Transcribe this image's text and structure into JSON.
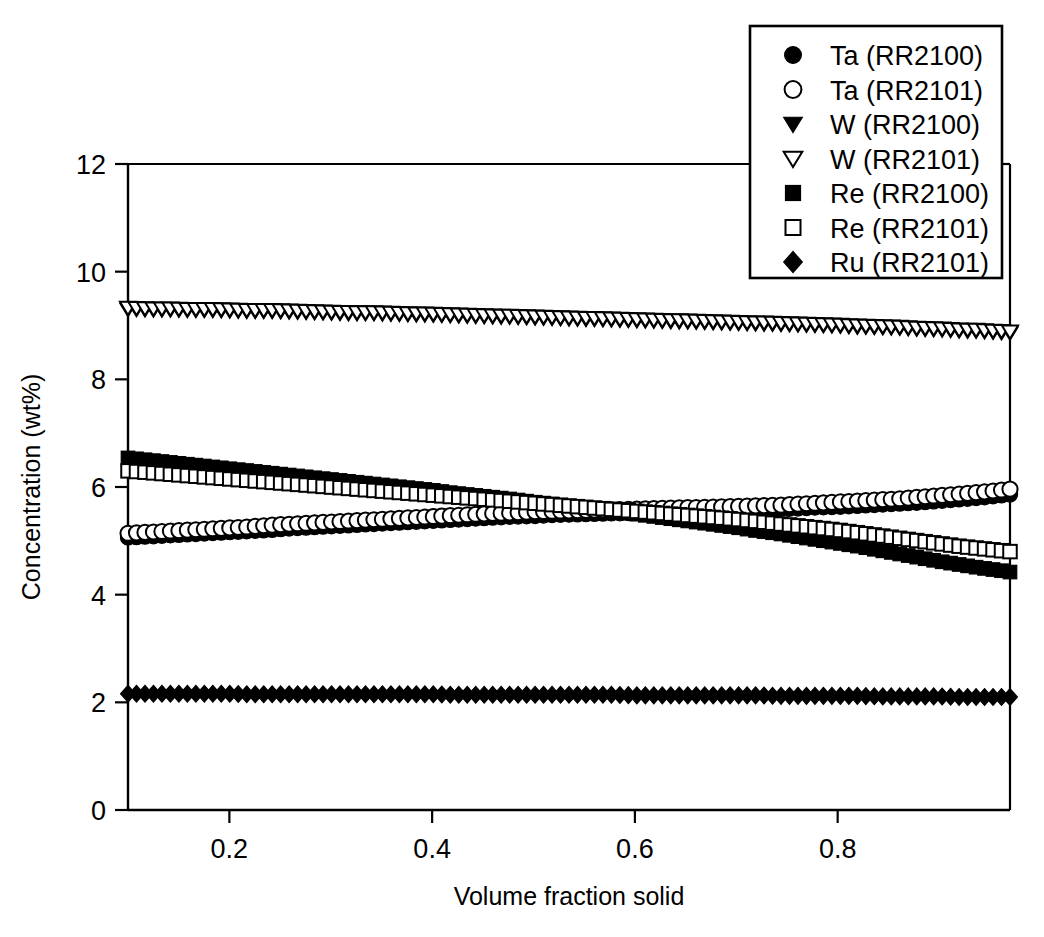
{
  "figure": {
    "background": "#ffffff",
    "ink_color": "#000000"
  },
  "axes": {
    "x_title": "Volume fraction solid",
    "y_title": "Concentration (wt%)",
    "x_ticklabels": [
      "0.2",
      "0.4",
      "0.6",
      "0.8"
    ],
    "y_ticklabels": [
      "0",
      "2",
      "4",
      "6",
      "8",
      "10",
      "12"
    ]
  },
  "legend": {
    "items": [
      {
        "label": "Ta (RR2100)",
        "marker": "filled-circle-marker"
      },
      {
        "label": "Ta (RR2101)",
        "marker": "open-circle-marker"
      },
      {
        "label": "W (RR2100)",
        "marker": "filled-triangle-down-marker"
      },
      {
        "label": "W (RR2101)",
        "marker": "open-triangle-down-marker"
      },
      {
        "label": "Re (RR2100)",
        "marker": "filled-square-marker"
      },
      {
        "label": "Re (RR2101)",
        "marker": "open-square-marker"
      },
      {
        "label": "Ru (RR2101)",
        "marker": "filled-diamond-marker"
      }
    ]
  },
  "chart_data": {
    "type": "scatter",
    "title": "",
    "xlabel": "Volume fraction solid",
    "ylabel": "Concentration (wt%)",
    "xlim": [
      0.1,
      0.97
    ],
    "ylim": [
      0,
      12
    ],
    "xticks": [
      0.2,
      0.4,
      0.6,
      0.8
    ],
    "yticks": [
      0,
      2,
      4,
      6,
      8,
      10,
      12
    ],
    "grid": false,
    "legend_position": "top-right",
    "x": [
      0.1,
      0.12,
      0.14,
      0.16,
      0.18,
      0.2,
      0.22,
      0.24,
      0.26,
      0.28,
      0.3,
      0.32,
      0.34,
      0.36,
      0.38,
      0.4,
      0.42,
      0.44,
      0.46,
      0.48,
      0.5,
      0.52,
      0.54,
      0.56,
      0.58,
      0.6,
      0.62,
      0.64,
      0.66,
      0.68,
      0.7,
      0.72,
      0.74,
      0.76,
      0.78,
      0.8,
      0.82,
      0.84,
      0.86,
      0.88,
      0.9,
      0.92,
      0.94,
      0.96,
      0.97
    ],
    "series": [
      {
        "name": "Ta (RR2100)",
        "marker": "filled-circle-marker",
        "filled": true,
        "shape": "circle",
        "values": [
          5.06,
          5.08,
          5.1,
          5.12,
          5.14,
          5.16,
          5.18,
          5.2,
          5.23,
          5.25,
          5.27,
          5.29,
          5.31,
          5.33,
          5.35,
          5.37,
          5.39,
          5.41,
          5.43,
          5.45,
          5.46,
          5.48,
          5.49,
          5.5,
          5.51,
          5.52,
          5.53,
          5.54,
          5.55,
          5.56,
          5.57,
          5.58,
          5.59,
          5.6,
          5.62,
          5.63,
          5.65,
          5.67,
          5.69,
          5.71,
          5.74,
          5.77,
          5.8,
          5.84,
          5.86
        ]
      },
      {
        "name": "Ta (RR2101)",
        "marker": "open-circle-marker",
        "filled": false,
        "shape": "circle",
        "values": [
          5.14,
          5.16,
          5.18,
          5.2,
          5.22,
          5.24,
          5.26,
          5.29,
          5.31,
          5.33,
          5.35,
          5.37,
          5.39,
          5.41,
          5.43,
          5.45,
          5.47,
          5.49,
          5.51,
          5.52,
          5.54,
          5.55,
          5.56,
          5.57,
          5.58,
          5.59,
          5.6,
          5.61,
          5.62,
          5.63,
          5.64,
          5.65,
          5.66,
          5.68,
          5.7,
          5.72,
          5.74,
          5.76,
          5.78,
          5.81,
          5.84,
          5.87,
          5.9,
          5.94,
          5.96
        ]
      },
      {
        "name": "W (RR2100)",
        "marker": "filled-triangle-down-marker",
        "filled": true,
        "shape": "triangle-down",
        "values": [
          9.3,
          9.29,
          9.29,
          9.28,
          9.28,
          9.27,
          9.26,
          9.26,
          9.25,
          9.24,
          9.23,
          9.22,
          9.22,
          9.21,
          9.2,
          9.19,
          9.18,
          9.17,
          9.16,
          9.15,
          9.14,
          9.13,
          9.12,
          9.11,
          9.1,
          9.09,
          9.08,
          9.07,
          9.06,
          9.05,
          9.04,
          9.03,
          9.02,
          9.01,
          9.0,
          8.99,
          8.97,
          8.96,
          8.95,
          8.93,
          8.92,
          8.9,
          8.89,
          8.87,
          8.86
        ]
      },
      {
        "name": "W (RR2101)",
        "marker": "open-triangle-down-marker",
        "filled": false,
        "shape": "triangle-down",
        "values": [
          9.33,
          9.32,
          9.32,
          9.31,
          9.31,
          9.3,
          9.29,
          9.29,
          9.28,
          9.27,
          9.26,
          9.25,
          9.25,
          9.24,
          9.23,
          9.22,
          9.21,
          9.2,
          9.19,
          9.18,
          9.17,
          9.16,
          9.15,
          9.14,
          9.13,
          9.12,
          9.11,
          9.1,
          9.09,
          9.08,
          9.07,
          9.06,
          9.05,
          9.04,
          9.03,
          9.02,
          9.0,
          8.99,
          8.98,
          8.96,
          8.95,
          8.93,
          8.92,
          8.9,
          8.89
        ]
      },
      {
        "name": "Re (RR2100)",
        "marker": "filled-square-marker",
        "filled": true,
        "shape": "square",
        "values": [
          6.54,
          6.5,
          6.46,
          6.42,
          6.38,
          6.34,
          6.3,
          6.26,
          6.22,
          6.18,
          6.14,
          6.1,
          6.06,
          6.02,
          5.98,
          5.94,
          5.89,
          5.85,
          5.81,
          5.77,
          5.72,
          5.68,
          5.63,
          5.59,
          5.54,
          5.5,
          5.45,
          5.4,
          5.35,
          5.3,
          5.25,
          5.19,
          5.14,
          5.08,
          5.02,
          4.96,
          4.9,
          4.83,
          4.76,
          4.69,
          4.62,
          4.56,
          4.5,
          4.45,
          4.42
        ]
      },
      {
        "name": "Re (RR2101)",
        "marker": "open-square-marker",
        "filled": false,
        "shape": "square",
        "values": [
          6.3,
          6.27,
          6.24,
          6.21,
          6.18,
          6.15,
          6.12,
          6.09,
          6.06,
          6.03,
          6.0,
          5.97,
          5.94,
          5.91,
          5.88,
          5.85,
          5.82,
          5.79,
          5.76,
          5.73,
          5.7,
          5.67,
          5.64,
          5.61,
          5.58,
          5.55,
          5.52,
          5.49,
          5.46,
          5.43,
          5.4,
          5.36,
          5.32,
          5.28,
          5.24,
          5.2,
          5.15,
          5.1,
          5.05,
          5.0,
          4.95,
          4.9,
          4.86,
          4.82,
          4.8
        ]
      },
      {
        "name": "Ru (RR2101)",
        "marker": "filled-diamond-marker",
        "filled": true,
        "shape": "diamond",
        "values": [
          2.16,
          2.16,
          2.16,
          2.16,
          2.16,
          2.16,
          2.15,
          2.15,
          2.15,
          2.15,
          2.15,
          2.15,
          2.15,
          2.15,
          2.15,
          2.15,
          2.14,
          2.14,
          2.14,
          2.14,
          2.14,
          2.14,
          2.14,
          2.14,
          2.14,
          2.13,
          2.13,
          2.13,
          2.13,
          2.13,
          2.13,
          2.13,
          2.12,
          2.12,
          2.12,
          2.12,
          2.12,
          2.11,
          2.11,
          2.11,
          2.11,
          2.1,
          2.1,
          2.1,
          2.1
        ]
      }
    ]
  }
}
